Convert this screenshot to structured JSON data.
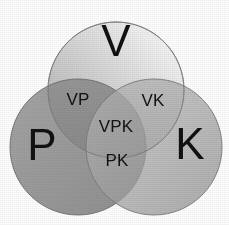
{
  "diagram": {
    "type": "venn",
    "title": "",
    "set_count": 3,
    "canvas": {
      "width": 229,
      "height": 225,
      "background": "#ffffff"
    },
    "sets": [
      {
        "id": "V",
        "label": "V",
        "position": "top",
        "center": {
          "x": 116,
          "y": 90
        },
        "radius": 68,
        "fill_light": "#f2f2f2",
        "fill_dark": "#a8a8a8",
        "stroke": "#8a8a8a",
        "label_pos": {
          "x": 116,
          "y": 41
        }
      },
      {
        "id": "P",
        "label": "P",
        "position": "bottom-left",
        "center": {
          "x": 78,
          "y": 147
        },
        "radius": 68,
        "fill_light": "#9a9a9a",
        "fill_dark": "#6e6e6e",
        "stroke": "#6f6f6f",
        "label_pos": {
          "x": 42,
          "y": 145
        }
      },
      {
        "id": "K",
        "label": "K",
        "position": "bottom-right",
        "center": {
          "x": 154,
          "y": 147
        },
        "radius": 68,
        "fill_light": "#bdbdbd",
        "fill_dark": "#8e8e8e",
        "stroke": "#7d7d7d",
        "label_pos": {
          "x": 190,
          "y": 144
        }
      }
    ],
    "regions": [
      {
        "id": "VP",
        "label": "VP",
        "label_pos": {
          "x": 78,
          "y": 99
        },
        "sets": [
          "V",
          "P"
        ]
      },
      {
        "id": "VK",
        "label": "VK",
        "label_pos": {
          "x": 153,
          "y": 100
        },
        "sets": [
          "V",
          "K"
        ]
      },
      {
        "id": "PK",
        "label": "PK",
        "label_pos": {
          "x": 117,
          "y": 160
        },
        "sets": [
          "P",
          "K"
        ]
      },
      {
        "id": "VPK",
        "label": "VPK",
        "label_pos": {
          "x": 116,
          "y": 126
        },
        "sets": [
          "V",
          "P",
          "K"
        ]
      }
    ],
    "colors": {
      "text": "#111111",
      "background": "#ffffff",
      "outline": "#7d7d7d"
    }
  }
}
